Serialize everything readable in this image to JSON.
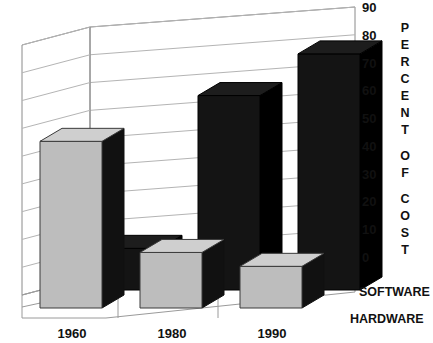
{
  "chart_data": {
    "type": "bar",
    "title": "",
    "subtitle": "",
    "xlabel": "",
    "ylabel": "PERCENT OF COST",
    "ylabel_chars": [
      "P",
      "E",
      "R",
      "C",
      "E",
      "N",
      "T",
      "",
      "O",
      "F",
      "",
      "C",
      "O",
      "S",
      "T"
    ],
    "categories": [
      "1960",
      "1980",
      "1990"
    ],
    "ytick_labels": [
      "90",
      "80",
      "70",
      "60",
      "50",
      "40",
      "30",
      "20",
      "10",
      "0"
    ],
    "ytick_values": [
      90,
      80,
      70,
      60,
      50,
      40,
      30,
      20,
      10,
      0
    ],
    "ylim": [
      0,
      90
    ],
    "grid": true,
    "legend_position": "right-axis-3d-rows",
    "projection": "3d",
    "series": [
      {
        "name": "SOFTWARE",
        "color": "#141414",
        "row": "back",
        "values": [
          15,
          70,
          85
        ]
      },
      {
        "name": "HARDWARE",
        "color": "#bdbdbd",
        "row": "front",
        "values": [
          60,
          20,
          15
        ]
      }
    ],
    "annotations": []
  },
  "colors": {
    "gray_bar": "#bdbdbd",
    "gray_bar_top": "#cfcfcf",
    "black_bar": "#141414",
    "grid": "#b4b4b4",
    "frame": "#8a8a8a",
    "text": "#111111",
    "background": "#ffffff"
  }
}
